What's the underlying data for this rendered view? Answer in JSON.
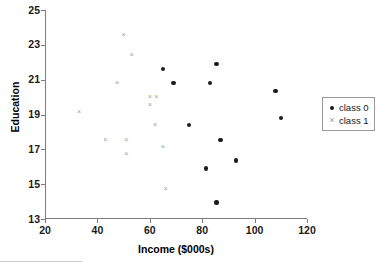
{
  "chart_data": {
    "type": "scatter",
    "title": "",
    "xlabel": "Income ($000s)",
    "ylabel": "Education",
    "xlim": [
      20,
      120
    ],
    "ylim": [
      13,
      25
    ],
    "xticks": [
      20,
      40,
      60,
      80,
      100,
      120
    ],
    "yticks": [
      13,
      15,
      17,
      19,
      21,
      23,
      25
    ],
    "grid": false,
    "legend_position": "right",
    "series": [
      {
        "name": "class 0",
        "marker": "filled-circle",
        "color": "#1c1c1c",
        "points": [
          [
            65,
            21.6
          ],
          [
            69,
            20.8
          ],
          [
            83,
            20.8
          ],
          [
            85.5,
            21.9
          ],
          [
            108,
            20.35
          ],
          [
            110,
            18.8
          ],
          [
            75,
            18.4
          ],
          [
            87,
            17.55
          ],
          [
            93,
            16.35
          ],
          [
            81.5,
            15.9
          ],
          [
            85.5,
            13.95
          ]
        ]
      },
      {
        "name": "class 1",
        "marker": "cross",
        "color": "#9a9a9a",
        "points": [
          [
            33,
            19.15
          ],
          [
            43,
            17.55
          ],
          [
            47.5,
            20.8
          ],
          [
            50,
            23.55
          ],
          [
            51,
            17.55
          ],
          [
            51,
            16.75
          ],
          [
            53,
            22.4
          ],
          [
            60,
            20.0
          ],
          [
            60,
            19.55
          ],
          [
            62.5,
            20.0
          ],
          [
            62,
            18.4
          ],
          [
            65,
            17.15
          ],
          [
            66,
            14.75
          ]
        ]
      }
    ]
  },
  "legend": {
    "entries": [
      {
        "label": "class 0",
        "marker_icon": "filled-circle-icon"
      },
      {
        "label": "class 1",
        "marker_icon": "cross-icon"
      }
    ]
  }
}
